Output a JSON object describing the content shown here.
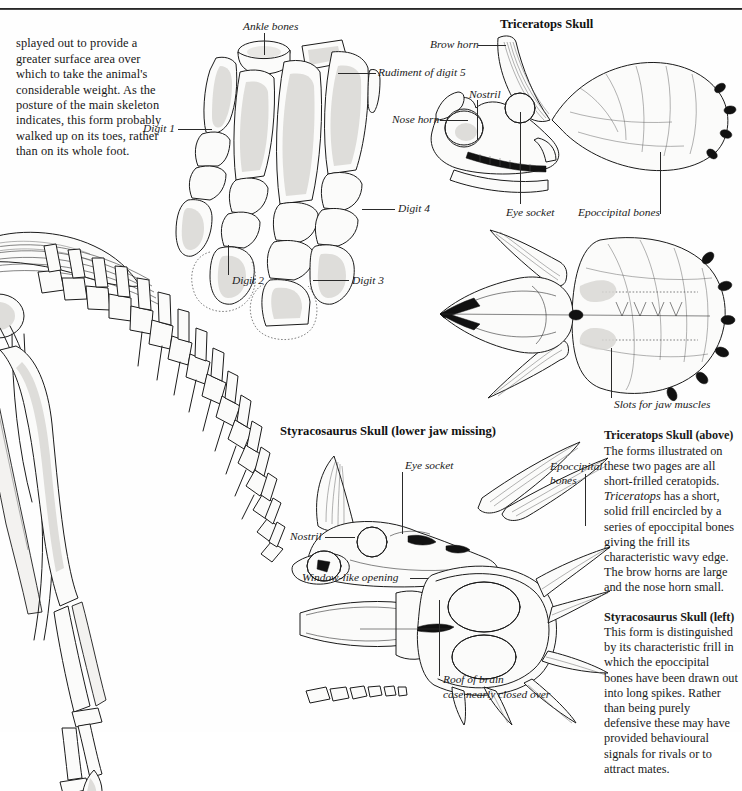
{
  "page": {
    "background": "#fefefe",
    "ink_color": "#1b1b1b",
    "width": 742,
    "height": 732
  },
  "intro_paragraph": "splayed out to provide a greater surface area over which to take the animal's considerable weight. As the posture of the main skeleton indicates, this form probably walked up on its toes, rather than on its whole foot.",
  "figures": {
    "skeleton": {
      "name": "partial ceratopsian skeleton, hind quarters and tail"
    },
    "foot": {
      "name": "hind foot bones",
      "labels": [
        {
          "text": "Ankle bones",
          "id": "ankle-bones"
        },
        {
          "text": "Rudiment of digit 5",
          "id": "rudiment-of-digit-5"
        },
        {
          "text": "Digit 1",
          "id": "digit-1"
        },
        {
          "text": "Digit 2",
          "id": "digit-2"
        },
        {
          "text": "Digit 3",
          "id": "digit-3"
        },
        {
          "text": "Digit 4",
          "id": "digit-4"
        }
      ]
    },
    "triceratops": {
      "title": "Triceratops Skull",
      "labels": [
        {
          "text": "Brow horn",
          "id": "brow-horn"
        },
        {
          "text": "Nostril",
          "id": "nostril"
        },
        {
          "text": "Nose horn",
          "id": "nose-horn"
        },
        {
          "text": "Eye socket",
          "id": "eye-socket"
        },
        {
          "text": "Epoccipital bones",
          "id": "epoccipital-bones"
        },
        {
          "text": "Slots for jaw muscles",
          "id": "slots-for-jaw-muscles"
        }
      ]
    },
    "styracosaurus": {
      "title": "Styracosaurus Skull  (lower jaw missing)",
      "labels": [
        {
          "text": "Eye socket",
          "id": "eye-socket"
        },
        {
          "text": "Epoccipital",
          "text2": "bones",
          "id": "epoccipital-bones"
        },
        {
          "text": "Nostril",
          "id": "nostril"
        },
        {
          "text": "Window-like opening",
          "id": "window-like-opening"
        },
        {
          "text": "Roof of brain",
          "text2": "case nearly closed over",
          "id": "roof-of-brain-case"
        }
      ]
    }
  },
  "captions": [
    {
      "heading": "Triceratops Skull (above)",
      "body_1": "The forms illustrated on these two pages are all short-frilled ceratopids. ",
      "body_italic": "Triceratops",
      "body_2": " has a short, solid frill encircled by a series of epoccipital bones giving the frill its characteristic wavy edge. The brow horns are large and the nose horn small."
    },
    {
      "heading": "Styracosaurus Skull (left)",
      "body_1": "This form is distinguished by its characteristic frill in which the epoccipital bones have been drawn out into long spikes. Rather than being purely defensive these may have provided behavioural signals for rivals or to attract mates.",
      "body_italic": "",
      "body_2": ""
    }
  ]
}
